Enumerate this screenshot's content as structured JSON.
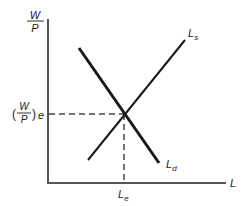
{
  "diagram": {
    "y_axis": {
      "label_numerator": "W",
      "label_denominator": "P"
    },
    "x_axis": {
      "label": "L"
    },
    "curves": {
      "supply": {
        "label_main": "L",
        "label_sub": "s"
      },
      "demand": {
        "label_main": "L",
        "label_sub": "d"
      }
    },
    "equilibrium": {
      "wage_paren_open": "(",
      "wage_numerator": "W",
      "wage_denominator": "P",
      "wage_paren_close": ")",
      "wage_sub": "e",
      "quantity_main": "L",
      "quantity_sub": "e"
    },
    "colors": {
      "axis": "#555555",
      "curve": "#1a1a1a",
      "dashed": "#444444"
    }
  }
}
